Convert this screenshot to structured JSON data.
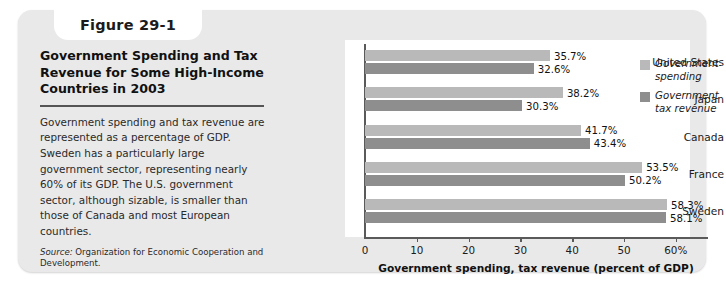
{
  "figure": {
    "number_label": "Figure 29-1",
    "title": "Government Spending and Tax Revenue for Some High-Income Countries in 2003",
    "body": "Government spending and tax revenue are represented as a percentage of GDP. Sweden has a particularly large government sector, representing nearly 60% of its GDP. The U.S. government sector, although sizable, is smaller than those of Canada and most European countries.",
    "source_label": "Source:",
    "source_text": " Organization for Economic Cooperation and Development."
  },
  "chart_data": {
    "type": "bar",
    "orientation": "horizontal",
    "title": "Government Spending and Tax Revenue for Some High-Income Countries in 2003",
    "xlabel": "Government spending, tax revenue (percent of GDP)",
    "ylabel": "",
    "categories": [
      "United States",
      "Japan",
      "Canada",
      "France",
      "Sweden"
    ],
    "series": [
      {
        "name": "Government spending",
        "color": "#b9b9b9",
        "values": [
          35.7,
          38.2,
          41.7,
          53.5,
          58.3
        ],
        "labels": [
          "35.7%",
          "38.2%",
          "41.7%",
          "53.5%",
          "58.3%"
        ]
      },
      {
        "name": "Government tax revenue",
        "color": "#8e8e8e",
        "values": [
          32.6,
          30.3,
          43.4,
          50.2,
          58.1
        ],
        "labels": [
          "32.6%",
          "30.3%",
          "43.4%",
          "50.2%",
          "58.1%"
        ]
      }
    ],
    "xlim": [
      0,
      65
    ],
    "xticks": [
      0,
      10,
      20,
      30,
      40,
      50,
      60
    ],
    "xtick_labels": [
      "0",
      "10",
      "20",
      "30",
      "40",
      "50",
      "60%"
    ],
    "grid": false,
    "legend_position": "right-top",
    "legend": [
      "Government spending",
      "Government tax revenue"
    ]
  }
}
